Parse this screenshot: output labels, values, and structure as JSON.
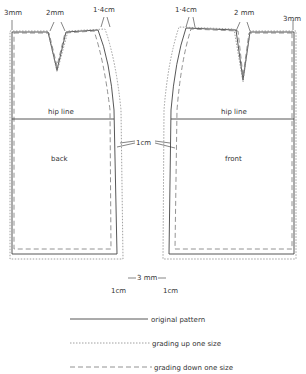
{
  "diagram": {
    "pieces": {
      "back": {
        "label": "back"
      },
      "front": {
        "label": "front"
      }
    },
    "lines": {
      "hip_left": "hip line",
      "hip_right": "hip line"
    },
    "measurements": {
      "back_side_top": "3mm",
      "back_dart": "2mm",
      "back_waist_side": "1·4cm",
      "front_waist_side": "1·4cm",
      "front_dart": "2 mm",
      "front_side_top": "3mm",
      "hip_side": "1cm",
      "hem_center": "3 mm",
      "hem_back_side": "1cm",
      "hem_front_side": "1cm"
    }
  },
  "legend": [
    {
      "style": "solid",
      "label": "original pattern"
    },
    {
      "style": "dotted",
      "label": "grading up one size"
    },
    {
      "style": "dashed",
      "label": "grading down one size"
    }
  ],
  "colors": {
    "line": "#444444",
    "background": "#ffffff"
  }
}
